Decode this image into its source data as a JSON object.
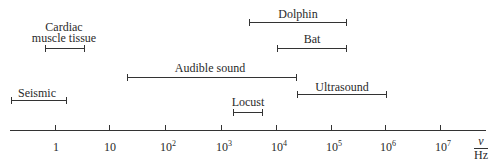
{
  "diagram": {
    "type": "frequency-range-diagram",
    "axis": {
      "scale": "log10",
      "unit_symbol": "ν",
      "unit": "Hz",
      "ticks": [
        {
          "label": "1",
          "base": "1",
          "exp": "",
          "x": 55
        },
        {
          "label": "10",
          "base": "10",
          "exp": "",
          "x": 109
        },
        {
          "label": "10^2",
          "base": "10",
          "exp": "2",
          "x": 165
        },
        {
          "label": "10^3",
          "base": "10",
          "exp": "3",
          "x": 221
        },
        {
          "label": "10^4",
          "base": "10",
          "exp": "4",
          "x": 276
        },
        {
          "label": "10^5",
          "base": "10",
          "exp": "5",
          "x": 331
        },
        {
          "label": "10^6",
          "base": "10",
          "exp": "6",
          "x": 385
        },
        {
          "label": "10^7",
          "base": "10",
          "exp": "7",
          "x": 440
        }
      ]
    },
    "ranges": [
      {
        "name": "Dolphin",
        "label": "Dolphin",
        "approx_hz": [
          3000,
          200000
        ]
      },
      {
        "name": "Cardiac muscle tissue",
        "label_line1": "Cardiac",
        "label_line2": "muscle tissue",
        "approx_hz": [
          0.7,
          3
        ]
      },
      {
        "name": "Bat",
        "label": "Bat",
        "approx_hz": [
          10000,
          200000
        ]
      },
      {
        "name": "Audible sound",
        "label": "Audible sound",
        "approx_hz": [
          20,
          20000
        ]
      },
      {
        "name": "Ultrasound",
        "label": "Ultrasound",
        "approx_hz": [
          20000,
          1000000
        ]
      },
      {
        "name": "Seismic",
        "label": "Seismic",
        "approx_hz": [
          0.1,
          1.5
        ]
      },
      {
        "name": "Locust",
        "label": "Locust",
        "approx_hz": [
          1500,
          5000
        ]
      }
    ]
  }
}
